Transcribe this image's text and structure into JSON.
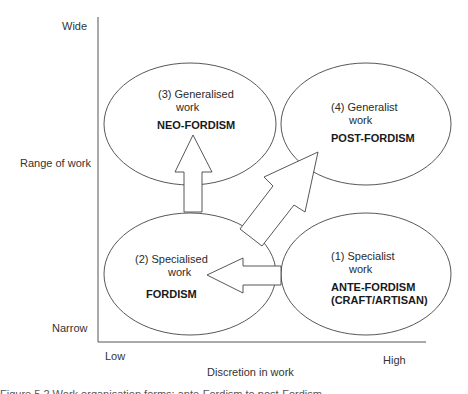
{
  "axes": {
    "y": {
      "label": "Range of work",
      "high": "Wide",
      "low": "Narrow"
    },
    "x": {
      "label": "Discretion in work",
      "low": "Low",
      "high": "High"
    }
  },
  "nodes": [
    {
      "id": "quadrant-1",
      "line1": "(1) Specialist",
      "line2": "work",
      "title": "ANTE-FORDISM",
      "title2": "(CRAFT/ARTISAN)",
      "position": "bottom-right"
    },
    {
      "id": "quadrant-2",
      "line1": "(2) Specialised",
      "line2": "work",
      "title": "FORDISM",
      "position": "bottom-left"
    },
    {
      "id": "quadrant-3",
      "line1": "(3) Generalised",
      "line2": "work",
      "title": "NEO-FORDISM",
      "position": "top-left"
    },
    {
      "id": "quadrant-4",
      "line1": "(4) Generalist",
      "line2": "work",
      "title": "POST-FORDISM",
      "position": "top-right"
    }
  ],
  "arrows": [
    {
      "from": "quadrant-1",
      "to": "quadrant-2",
      "direction": "left"
    },
    {
      "from": "quadrant-2",
      "to": "quadrant-3",
      "direction": "up"
    },
    {
      "from": "quadrant-2",
      "to": "quadrant-4",
      "direction": "diagonal-up-right"
    }
  ],
  "caption": "Figure 5.2 Work organisation forms: ante-Fordism to post-Fordism",
  "colors": {
    "stroke": "#444444",
    "fill": "#ffffff",
    "text": "#2a2a2a"
  }
}
